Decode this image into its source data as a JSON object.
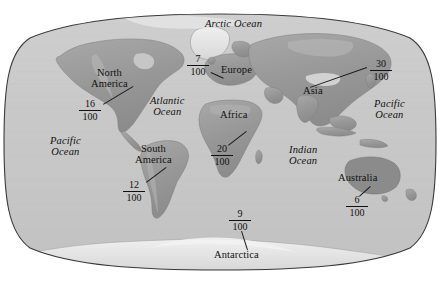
{
  "figure": {
    "type": "world-map-diagram",
    "projection": "robinson",
    "background_color": "#ffffff",
    "ocean_color": "#c9c9c9",
    "land_color": "#9a9a9a",
    "outline_color": "#3a3a3a",
    "text_color": "#111111"
  },
  "oceans": [
    {
      "name": "arctic-ocean",
      "label": "Arctic Ocean",
      "x": 205,
      "y": 19
    },
    {
      "name": "atlantic-ocean",
      "label": "Atlantic\nOcean",
      "x": 150,
      "y": 96
    },
    {
      "name": "pacific-ocean-left",
      "label": "Pacific\nOcean",
      "x": 50,
      "y": 136
    },
    {
      "name": "pacific-ocean-right",
      "label": "Pacific\nOcean",
      "x": 374,
      "y": 99
    },
    {
      "name": "indian-ocean",
      "label": "Indian\nOcean",
      "x": 289,
      "y": 145
    }
  ],
  "continents": [
    {
      "name": "north-america",
      "label": "North\nAmerica",
      "x": 91,
      "y": 68
    },
    {
      "name": "europe",
      "label": "Europe",
      "x": 221,
      "y": 65
    },
    {
      "name": "asia",
      "label": "Asia",
      "x": 303,
      "y": 86
    },
    {
      "name": "africa",
      "label": "Africa",
      "x": 220,
      "y": 110
    },
    {
      "name": "south-america",
      "label": "South\nAmerica",
      "x": 135,
      "y": 144
    },
    {
      "name": "australia",
      "label": "Australia",
      "x": 338,
      "y": 173
    },
    {
      "name": "antarctica",
      "label": "Antarctica",
      "x": 214,
      "y": 250
    }
  ],
  "fractions": [
    {
      "name": "fraction-greenland",
      "numerator": "7",
      "denominator": "100",
      "x": 185,
      "y": 54,
      "leader": {
        "x1": 211,
        "y1": 72,
        "x2": 224,
        "y2": 78
      }
    },
    {
      "name": "fraction-north-america",
      "numerator": "16",
      "denominator": "100",
      "x": 77,
      "y": 99,
      "leader": {
        "x1": 103,
        "y1": 104,
        "x2": 133,
        "y2": 86
      }
    },
    {
      "name": "fraction-asia",
      "numerator": "30",
      "denominator": "100",
      "x": 368,
      "y": 59,
      "leader": {
        "x1": 367,
        "y1": 68,
        "x2": 310,
        "y2": 88
      }
    },
    {
      "name": "fraction-africa",
      "numerator": "20",
      "denominator": "100",
      "x": 209,
      "y": 144,
      "leader": {
        "x1": 228,
        "y1": 145,
        "x2": 246,
        "y2": 131
      }
    },
    {
      "name": "fraction-south-america",
      "numerator": "12",
      "denominator": "100",
      "x": 121,
      "y": 180,
      "leader": {
        "x1": 146,
        "y1": 182,
        "x2": 166,
        "y2": 167
      }
    },
    {
      "name": "fraction-australia",
      "numerator": "6",
      "denominator": "100",
      "x": 344,
      "y": 195,
      "leader": {
        "x1": 359,
        "y1": 196,
        "x2": 370,
        "y2": 186
      }
    },
    {
      "name": "fraction-antarctica",
      "numerator": "9",
      "denominator": "100",
      "x": 227,
      "y": 209,
      "leader": {
        "x1": 242,
        "y1": 231,
        "x2": 248,
        "y2": 250
      }
    }
  ]
}
